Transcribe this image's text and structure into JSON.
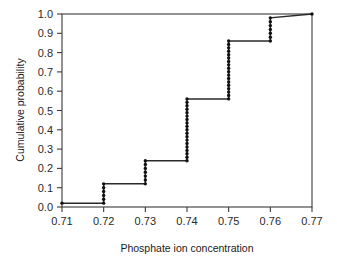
{
  "chart_data": {
    "type": "line",
    "subtype": "ecdf-step",
    "title": "",
    "subtitle": "",
    "xlabel": "Phosphate ion concentration",
    "ylabel": "Cumulative probability",
    "xlim": [
      0.71,
      0.77
    ],
    "ylim": [
      0.0,
      1.0
    ],
    "grid": false,
    "legend": false,
    "legend_position": "none",
    "xticks": [
      0.71,
      0.72,
      0.73,
      0.74,
      0.75,
      0.76,
      0.77
    ],
    "xtick_labels": [
      "0.71",
      "0.72",
      "0.73",
      "0.74",
      "0.75",
      "0.76",
      "0.77"
    ],
    "yticks": [
      0.0,
      0.1,
      0.2,
      0.3,
      0.4,
      0.5,
      0.6,
      0.7,
      0.8,
      0.9,
      1.0
    ],
    "ytick_labels": [
      "0.0",
      "0.1",
      "0.2",
      "0.3",
      "0.4",
      "0.5",
      "0.6",
      "0.7",
      "0.8",
      "0.9",
      "1.0"
    ],
    "series": [
      {
        "name": "Empirical CDF",
        "color": "#2b2b2b",
        "marker": "dot",
        "x": [
          0.71,
          0.72,
          0.73,
          0.74,
          0.75,
          0.76,
          0.77
        ],
        "values": [
          0.02,
          0.12,
          0.24,
          0.56,
          0.86,
          0.98,
          1.0
        ]
      }
    ],
    "steps": [
      {
        "x": 0.71,
        "from": 0.02,
        "to": 0.02,
        "n_markers": 1
      },
      {
        "x": 0.72,
        "from": 0.02,
        "to": 0.12,
        "n_markers": 6
      },
      {
        "x": 0.73,
        "from": 0.12,
        "to": 0.24,
        "n_markers": 7
      },
      {
        "x": 0.74,
        "from": 0.24,
        "to": 0.56,
        "n_markers": 19
      },
      {
        "x": 0.75,
        "from": 0.56,
        "to": 0.86,
        "n_markers": 18
      },
      {
        "x": 0.76,
        "from": 0.86,
        "to": 0.98,
        "n_markers": 7
      },
      {
        "x": 0.77,
        "from": 1.0,
        "to": 1.0,
        "n_markers": 1
      }
    ],
    "annotations": []
  },
  "axes": {
    "x_title": "Phosphate ion concentration",
    "y_title": "Cumulative probability"
  },
  "colors": {
    "line": "#2b2b2b",
    "marker": "#111111",
    "frame": "#3a3a3a",
    "text": "#1a1a1a",
    "background": "#ffffff"
  }
}
